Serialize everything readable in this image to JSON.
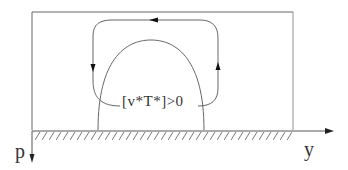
{
  "diagram": {
    "flux_label": "[v*T*]>0",
    "axes": {
      "vertical_label": "p",
      "horizontal_label": "y"
    },
    "colors": {
      "line": "#555555",
      "text": "#333333",
      "background": "#ffffff"
    },
    "elements": [
      "bounding-box",
      "ground-surface-hatched",
      "dome-contour",
      "circulation-loop-counterclockwise",
      "arrow-top-leftward",
      "arrow-left-downward",
      "arrow-right-upward"
    ]
  }
}
